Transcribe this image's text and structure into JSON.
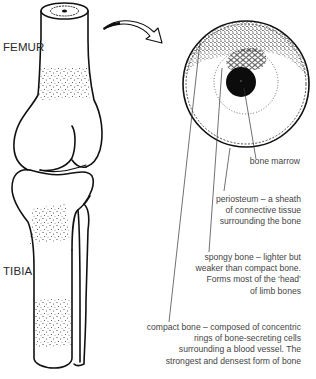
{
  "figure": {
    "type": "anatomical-diagram",
    "colors": {
      "line": "#1a1a1a",
      "text": "#444444",
      "background": "#ffffff"
    }
  },
  "bone_labels": {
    "femur": "FEMUR",
    "tibia": "TIBIA"
  },
  "callouts": [
    {
      "id": "bone-marrow",
      "lines": [
        "bone marrow"
      ]
    },
    {
      "id": "periosteum",
      "lines": [
        "periosteum – a sheath",
        "of connective tissue",
        "surrounding the bone"
      ]
    },
    {
      "id": "spongy-bone",
      "lines": [
        "spongy bone – lighter but",
        "weaker than compact bone.",
        "Forms most of the ‘head’",
        "of limb bones"
      ]
    },
    {
      "id": "compact-bone",
      "lines": [
        "compact bone – composed of concentric",
        "rings of bone-secreting cells",
        "surrounding a blood vessel. The",
        "strongest and densest form of bone"
      ]
    }
  ],
  "icons": {
    "magnify_arrow": "curved-arrow-icon"
  }
}
